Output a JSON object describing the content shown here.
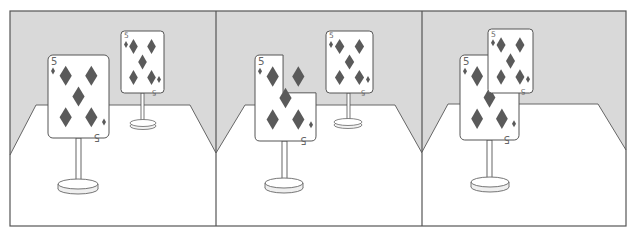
{
  "figure": {
    "panel_count": 3
  },
  "colors": {
    "wall": "#d9d9d9",
    "floor": "#ffffff",
    "outline": "#555555",
    "diamond": "#5a5a5a",
    "card_face": "#ffffff",
    "index_text": "#666666"
  },
  "card": {
    "rank": "5",
    "suit": "diamonds",
    "suit_glyph": "♦"
  },
  "panels": [
    {
      "label": "panel-1",
      "cards": [
        {
          "role": "back-card",
          "rank": "5",
          "suit": "diamonds"
        },
        {
          "role": "front-card",
          "rank": "5",
          "suit": "diamonds",
          "shape": "full"
        }
      ]
    },
    {
      "label": "panel-2",
      "cards": [
        {
          "role": "back-card",
          "rank": "5",
          "suit": "diamonds"
        },
        {
          "role": "front-card",
          "rank": "5",
          "suit": "diamonds",
          "shape": "notched"
        }
      ]
    },
    {
      "label": "panel-3",
      "cards": [
        {
          "role": "front-card",
          "rank": "5",
          "suit": "diamonds",
          "shape": "full"
        },
        {
          "role": "back-card",
          "rank": "5",
          "suit": "diamonds",
          "shape": "overlapping-in-front"
        }
      ]
    }
  ]
}
